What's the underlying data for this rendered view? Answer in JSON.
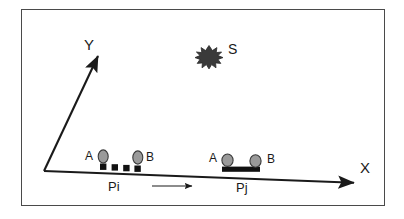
{
  "figure": {
    "kind": "schematic-diagram",
    "border_color": "#4a4a4a",
    "background": "#ffffff",
    "ink_color": "#1a1a1a",
    "body_fill": "#9a9a9a"
  },
  "axes": {
    "x": {
      "label": "X",
      "from": [
        44,
        171
      ],
      "to": [
        358,
        183
      ],
      "arrow": "right"
    },
    "y": {
      "label": "Y",
      "from": [
        44,
        171
      ],
      "to": [
        100,
        52
      ],
      "arrow": "up-right"
    }
  },
  "source": {
    "label": "S",
    "icon": "burst-star-icon",
    "center": [
      209,
      56
    ],
    "fill": "#3a3a3a"
  },
  "motion_arrow": {
    "name": "motion-arrow",
    "from": [
      152,
      186
    ],
    "to": [
      196,
      186
    ],
    "direction": "right"
  },
  "platforms": [
    {
      "id": "pi",
      "label": "Pi",
      "label_pos": [
        110,
        187
      ],
      "type": "segmented",
      "base": {
        "kind": "square-segments",
        "count": 4,
        "squares": [
          [
            100,
            164
          ],
          [
            112,
            165
          ],
          [
            124,
            166
          ],
          [
            135,
            166
          ]
        ],
        "size": 6,
        "fill": "#111111"
      },
      "nodes": [
        {
          "label": "A",
          "label_pos": [
            86,
            152
          ],
          "center": [
            103,
            156
          ],
          "rx": 5,
          "ry": 6.5,
          "fill": "#9a9a9a"
        },
        {
          "label": "B",
          "label_pos": [
            148,
            153
          ],
          "center": [
            138,
            157
          ],
          "rx": 5,
          "ry": 6.5,
          "fill": "#9a9a9a"
        }
      ]
    },
    {
      "id": "pj",
      "label": "Pj",
      "label_pos": [
        238,
        188
      ],
      "type": "rigid",
      "base": {
        "kind": "solid-bar",
        "x": 222,
        "y": 167,
        "width": 38,
        "height": 5,
        "fill": "#111111"
      },
      "nodes": [
        {
          "label": "A",
          "label_pos": [
            210,
            153
          ],
          "center": [
            227,
            160
          ],
          "rx": 5.5,
          "ry": 6,
          "fill": "#9a9a9a"
        },
        {
          "label": "B",
          "label_pos": [
            268,
            154
          ],
          "center": [
            255,
            161
          ],
          "rx": 5.5,
          "ry": 6,
          "fill": "#9a9a9a"
        }
      ]
    }
  ]
}
